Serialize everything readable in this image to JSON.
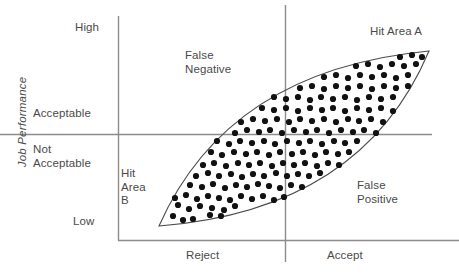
{
  "figure": {
    "y_axis_title": "Job Performance",
    "y_ticks": {
      "high": "High",
      "acceptable": "Acceptable",
      "not_acceptable": "Not\nAcceptable",
      "low": "Low"
    },
    "x_ticks": {
      "reject": "Reject",
      "accept": "Accept"
    },
    "quadrant_labels": {
      "false_negative": "False\nNegative",
      "false_positive": "False\nPositive",
      "hit_area_a": "Hit Area A",
      "hit_area_b": "Hit\nArea\nB"
    },
    "colors": {
      "axis": "#8c8c8c",
      "ellipse_stroke": "#4a4a4a",
      "point_fill": "#111111",
      "text": "#4a4a4a"
    }
  },
  "chart_data": {
    "type": "scatter",
    "title": "",
    "xlabel": "",
    "ylabel": "Job Performance",
    "xtick_labels": [
      "Reject",
      "Accept"
    ],
    "ytick_labels": [
      "High",
      "Acceptable",
      "Not Acceptable",
      "Low"
    ],
    "grid": false,
    "legend": null,
    "annotations": [
      {
        "text": "False Negative",
        "quadrant": "top-left"
      },
      {
        "text": "False Positive",
        "quadrant": "bottom-right"
      },
      {
        "text": "Hit Area A",
        "quadrant": "top-right"
      },
      {
        "text": "Hit Area B",
        "quadrant": "bottom-left"
      }
    ],
    "reference_lines": [
      {
        "orientation": "horizontal",
        "label": "Acceptable performance cutoff",
        "y_px": 134
      },
      {
        "orientation": "vertical",
        "label": "Selection cutoff (Reject / Accept)",
        "x_px": 285
      }
    ],
    "envelope": {
      "shape": "lens",
      "p_start": [
        159,
        226
      ],
      "p_end": [
        429,
        51
      ],
      "upper_control": [
        228,
        70
      ],
      "lower_control": [
        362,
        210
      ],
      "description": "Positively correlated elliptical scatter envelope"
    },
    "points": [
      [
        173,
        216
      ],
      [
        183,
        220
      ],
      [
        193,
        219
      ],
      [
        203,
        222
      ],
      [
        210,
        215
      ],
      [
        221,
        216
      ],
      [
        232,
        218
      ],
      [
        166,
        208
      ],
      [
        178,
        205
      ],
      [
        189,
        209
      ],
      [
        200,
        206
      ],
      [
        212,
        208
      ],
      [
        224,
        210
      ],
      [
        235,
        206
      ],
      [
        245,
        212
      ],
      [
        256,
        208
      ],
      [
        163,
        197
      ],
      [
        175,
        198
      ],
      [
        186,
        195
      ],
      [
        197,
        199
      ],
      [
        208,
        196
      ],
      [
        219,
        198
      ],
      [
        230,
        200
      ],
      [
        241,
        196
      ],
      [
        252,
        199
      ],
      [
        263,
        196
      ],
      [
        274,
        200
      ],
      [
        284,
        197
      ],
      [
        295,
        199
      ],
      [
        306,
        196
      ],
      [
        167,
        186
      ],
      [
        179,
        188
      ],
      [
        190,
        185
      ],
      [
        202,
        187
      ],
      [
        213,
        184
      ],
      [
        225,
        188
      ],
      [
        236,
        185
      ],
      [
        247,
        187
      ],
      [
        258,
        184
      ],
      [
        269,
        186
      ],
      [
        280,
        188
      ],
      [
        291,
        185
      ],
      [
        302,
        187
      ],
      [
        313,
        184
      ],
      [
        324,
        187
      ],
      [
        162,
        175
      ],
      [
        173,
        177
      ],
      [
        185,
        174
      ],
      [
        196,
        176
      ],
      [
        208,
        173
      ],
      [
        219,
        176
      ],
      [
        231,
        174
      ],
      [
        242,
        177
      ],
      [
        253,
        174
      ],
      [
        264,
        176
      ],
      [
        276,
        173
      ],
      [
        287,
        176
      ],
      [
        298,
        174
      ],
      [
        309,
        176
      ],
      [
        320,
        173
      ],
      [
        331,
        176
      ],
      [
        342,
        174
      ],
      [
        168,
        164
      ],
      [
        180,
        166
      ],
      [
        191,
        163
      ],
      [
        203,
        165
      ],
      [
        214,
        163
      ],
      [
        226,
        166
      ],
      [
        238,
        163
      ],
      [
        249,
        165
      ],
      [
        260,
        163
      ],
      [
        272,
        166
      ],
      [
        283,
        163
      ],
      [
        294,
        165
      ],
      [
        305,
        163
      ],
      [
        317,
        166
      ],
      [
        328,
        163
      ],
      [
        339,
        165
      ],
      [
        350,
        163
      ],
      [
        361,
        166
      ],
      [
        164,
        153
      ],
      [
        176,
        155
      ],
      [
        188,
        152
      ],
      [
        199,
        154
      ],
      [
        211,
        152
      ],
      [
        222,
        155
      ],
      [
        234,
        152
      ],
      [
        246,
        154
      ],
      [
        257,
        152
      ],
      [
        269,
        155
      ],
      [
        280,
        152
      ],
      [
        292,
        154
      ],
      [
        303,
        152
      ],
      [
        315,
        155
      ],
      [
        326,
        152
      ],
      [
        338,
        154
      ],
      [
        349,
        152
      ],
      [
        361,
        155
      ],
      [
        372,
        152
      ],
      [
        170,
        142
      ],
      [
        182,
        144
      ],
      [
        194,
        141
      ],
      [
        205,
        143
      ],
      [
        217,
        141
      ],
      [
        229,
        144
      ],
      [
        240,
        141
      ],
      [
        252,
        143
      ],
      [
        264,
        141
      ],
      [
        275,
        144
      ],
      [
        287,
        141
      ],
      [
        299,
        143
      ],
      [
        310,
        141
      ],
      [
        322,
        144
      ],
      [
        334,
        141
      ],
      [
        345,
        143
      ],
      [
        357,
        141
      ],
      [
        369,
        144
      ],
      [
        380,
        141
      ],
      [
        176,
        131
      ],
      [
        188,
        133
      ],
      [
        200,
        130
      ],
      [
        211,
        132
      ],
      [
        223,
        130
      ],
      [
        235,
        133
      ],
      [
        247,
        130
      ],
      [
        259,
        132
      ],
      [
        270,
        130
      ],
      [
        282,
        133
      ],
      [
        294,
        130
      ],
      [
        306,
        132
      ],
      [
        317,
        130
      ],
      [
        329,
        133
      ],
      [
        341,
        130
      ],
      [
        353,
        132
      ],
      [
        364,
        130
      ],
      [
        376,
        133
      ],
      [
        388,
        130
      ],
      [
        182,
        120
      ],
      [
        194,
        122
      ],
      [
        206,
        119
      ],
      [
        218,
        121
      ],
      [
        230,
        119
      ],
      [
        241,
        122
      ],
      [
        253,
        119
      ],
      [
        265,
        121
      ],
      [
        277,
        119
      ],
      [
        289,
        122
      ],
      [
        300,
        119
      ],
      [
        312,
        121
      ],
      [
        324,
        119
      ],
      [
        336,
        122
      ],
      [
        348,
        119
      ],
      [
        359,
        121
      ],
      [
        371,
        119
      ],
      [
        383,
        122
      ],
      [
        395,
        119
      ],
      [
        191,
        109
      ],
      [
        203,
        111
      ],
      [
        215,
        108
      ],
      [
        227,
        110
      ],
      [
        239,
        108
      ],
      [
        250,
        111
      ],
      [
        262,
        108
      ],
      [
        274,
        110
      ],
      [
        286,
        108
      ],
      [
        298,
        111
      ],
      [
        310,
        108
      ],
      [
        322,
        110
      ],
      [
        333,
        108
      ],
      [
        345,
        111
      ],
      [
        357,
        108
      ],
      [
        369,
        110
      ],
      [
        381,
        108
      ],
      [
        393,
        111
      ],
      [
        404,
        108
      ],
      [
        202,
        98
      ],
      [
        214,
        100
      ],
      [
        226,
        97
      ],
      [
        238,
        99
      ],
      [
        250,
        97
      ],
      [
        262,
        100
      ],
      [
        274,
        97
      ],
      [
        286,
        99
      ],
      [
        298,
        97
      ],
      [
        310,
        100
      ],
      [
        321,
        97
      ],
      [
        333,
        99
      ],
      [
        345,
        97
      ],
      [
        357,
        100
      ],
      [
        369,
        97
      ],
      [
        381,
        99
      ],
      [
        393,
        97
      ],
      [
        405,
        100
      ],
      [
        414,
        97
      ],
      [
        216,
        87
      ],
      [
        228,
        89
      ],
      [
        240,
        86
      ],
      [
        252,
        88
      ],
      [
        264,
        86
      ],
      [
        276,
        89
      ],
      [
        288,
        86
      ],
      [
        300,
        88
      ],
      [
        312,
        86
      ],
      [
        324,
        89
      ],
      [
        336,
        86
      ],
      [
        348,
        88
      ],
      [
        360,
        86
      ],
      [
        372,
        89
      ],
      [
        384,
        86
      ],
      [
        396,
        88
      ],
      [
        408,
        86
      ],
      [
        419,
        88
      ],
      [
        240,
        76
      ],
      [
        252,
        78
      ],
      [
        264,
        75
      ],
      [
        276,
        77
      ],
      [
        288,
        75
      ],
      [
        300,
        78
      ],
      [
        312,
        75
      ],
      [
        324,
        77
      ],
      [
        336,
        75
      ],
      [
        348,
        78
      ],
      [
        360,
        75
      ],
      [
        372,
        77
      ],
      [
        384,
        75
      ],
      [
        396,
        78
      ],
      [
        408,
        75
      ],
      [
        420,
        77
      ],
      [
        272,
        65
      ],
      [
        284,
        67
      ],
      [
        296,
        64
      ],
      [
        308,
        66
      ],
      [
        320,
        64
      ],
      [
        332,
        67
      ],
      [
        344,
        64
      ],
      [
        356,
        66
      ],
      [
        368,
        64
      ],
      [
        380,
        67
      ],
      [
        392,
        64
      ],
      [
        404,
        66
      ],
      [
        416,
        64
      ],
      [
        425,
        66
      ],
      [
        330,
        56
      ],
      [
        344,
        57
      ],
      [
        358,
        55
      ],
      [
        372,
        57
      ],
      [
        386,
        55
      ],
      [
        400,
        57
      ],
      [
        412,
        55
      ],
      [
        422,
        57
      ]
    ]
  }
}
